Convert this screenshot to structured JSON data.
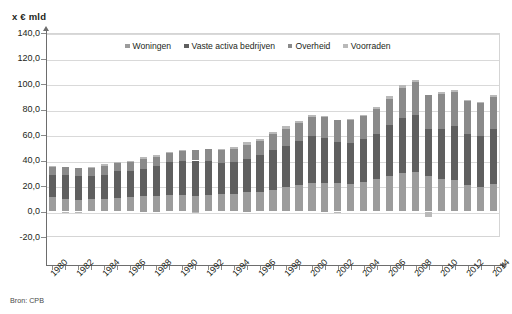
{
  "axis_title": "x € mld",
  "source_note": "Bron: CPB",
  "colors": {
    "woningen": "#9c9c9c",
    "vaste_activa_bedrijven": "#5f5f5f",
    "overheid": "#8a8a8a",
    "voorraden": "#b9b9b9",
    "gridline": "#d9d9d9",
    "axis": "#6d6d6d",
    "text": "#231f20",
    "background": "#ffffff"
  },
  "legend": {
    "position": "top-center",
    "items": [
      {
        "label": "Woningen",
        "color": "#9c9c9c"
      },
      {
        "label": "Vaste activa bedrijven",
        "color": "#5f5f5f"
      },
      {
        "label": "Overheid",
        "color": "#8a8a8a"
      },
      {
        "label": "Voorraden",
        "color": "#b9b9b9"
      }
    ]
  },
  "chart_data": {
    "type": "bar",
    "stacked": true,
    "title": "",
    "subtitle": "",
    "xlabel": "",
    "ylabel": "x € mld",
    "ylim": [
      -20.0,
      140.0
    ],
    "ytick_step": 20.0,
    "ytick_labels": [
      "140,0",
      "120,0",
      "100,0",
      "80,0",
      "60,0",
      "40,0",
      "20,0",
      "0,0",
      "-20,0"
    ],
    "ytick_values": [
      140.0,
      120.0,
      100.0,
      80.0,
      60.0,
      40.0,
      20.0,
      0.0,
      -20.0
    ],
    "grid": true,
    "decimal_separator": ",",
    "xtick_labels": [
      "1980",
      "1982",
      "1984",
      "1986",
      "1988",
      "1990",
      "1992",
      "1994",
      "1996",
      "1998",
      "2000",
      "2002",
      "2004",
      "2006",
      "2008",
      "2010",
      "2012",
      "2014"
    ],
    "xtick_label_rotation": -45,
    "categories": [
      "1980",
      "1981",
      "1982",
      "1983",
      "1984",
      "1985",
      "1986",
      "1987",
      "1988",
      "1989",
      "1990",
      "1991",
      "1992",
      "1993",
      "1994",
      "1995",
      "1996",
      "1997",
      "1998",
      "1999",
      "2000",
      "2001",
      "2002",
      "2003",
      "2004",
      "2005",
      "2006",
      "2007",
      "2008",
      "2009",
      "2010",
      "2011",
      "2012",
      "2013",
      "2014"
    ],
    "series": [
      {
        "name": "Woningen",
        "color": "#9c9c9c",
        "values": [
          11.0,
          9.5,
          9.0,
          9.5,
          9.5,
          10.5,
          11.5,
          12.5,
          12.5,
          13.0,
          13.0,
          12.5,
          13.0,
          13.5,
          14.0,
          15.0,
          15.5,
          17.0,
          19.0,
          21.0,
          22.0,
          22.5,
          22.0,
          21.5,
          23.5,
          25.5,
          28.0,
          30.5,
          31.0,
          28.0,
          25.5,
          24.5,
          20.5,
          19.0,
          21.5
        ]
      },
      {
        "name": "Vaste activa bedrijven",
        "color": "#5f5f5f",
        "values": [
          17.5,
          19.0,
          18.5,
          18.0,
          19.5,
          21.0,
          20.0,
          20.5,
          23.0,
          25.5,
          26.5,
          27.5,
          26.5,
          24.5,
          24.5,
          26.5,
          28.5,
          31.5,
          32.5,
          34.0,
          37.0,
          35.5,
          32.5,
          32.0,
          33.0,
          35.5,
          39.5,
          43.0,
          44.5,
          37.0,
          39.5,
          42.5,
          40.0,
          40.5,
          43.0
        ]
      },
      {
        "name": "Overheid",
        "color": "#8a8a8a",
        "values": [
          7.0,
          6.5,
          6.5,
          7.0,
          6.5,
          6.5,
          7.5,
          8.0,
          7.5,
          7.5,
          8.0,
          8.5,
          9.5,
          10.0,
          10.5,
          11.0,
          11.5,
          12.5,
          13.0,
          14.5,
          15.5,
          16.5,
          17.5,
          18.0,
          18.5,
          19.5,
          21.0,
          23.0,
          26.0,
          26.5,
          27.5,
          27.0,
          26.5,
          25.5,
          25.0
        ]
      },
      {
        "name": "Voorraden",
        "color": "#b9b9b9",
        "values": [
          0.5,
          -1.0,
          -1.5,
          0.5,
          2.0,
          0.5,
          1.0,
          1.5,
          1.0,
          1.0,
          1.0,
          -1.5,
          0.0,
          1.0,
          1.5,
          2.0,
          1.0,
          1.0,
          2.5,
          1.5,
          1.5,
          0.5,
          -0.5,
          1.0,
          1.0,
          1.5,
          2.0,
          2.5,
          2.0,
          -4.5,
          1.0,
          1.0,
          0.5,
          1.0,
          2.0
        ]
      }
    ],
    "totals": [
      36.0,
      34.0,
      32.5,
      35.0,
      37.5,
      38.5,
      40.0,
      42.5,
      44.0,
      47.0,
      48.5,
      47.0,
      49.0,
      49.0,
      50.5,
      54.5,
      56.5,
      62.0,
      67.0,
      71.0,
      76.0,
      75.0,
      71.5,
      72.5,
      76.0,
      82.0,
      90.5,
      99.0,
      103.5,
      87.0,
      93.5,
      95.0,
      87.5,
      86.0,
      91.5
    ]
  }
}
